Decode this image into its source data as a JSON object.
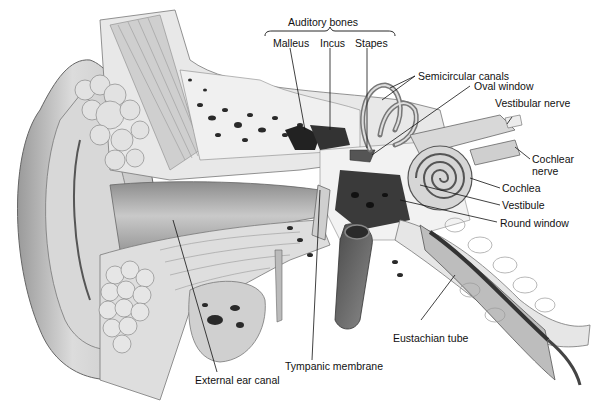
{
  "diagram": {
    "group_label": "Auditory bones",
    "labels": {
      "auditory_bones": "Auditory bones",
      "malleus": "Malleus",
      "incus": "Incus",
      "stapes": "Stapes",
      "semicircular_canals": "Semicircular canals",
      "oval_window": "Oval window",
      "vestibular_nerve": "Vestibular nerve",
      "cochlear_nerve_line1": "Cochlear",
      "cochlear_nerve_line2": "nerve",
      "cochlea": "Cochlea",
      "vestibule": "Vestibule",
      "round_window": "Round window",
      "eustachian_tube": "Eustachian tube",
      "tympanic_membrane": "Tympanic membrane",
      "external_ear_canal": "External ear canal"
    },
    "colors": {
      "background": "#ffffff",
      "tissue_light": "#e4e4e4",
      "tissue_mid": "#b8b8b8",
      "tissue_dark": "#5a5a5a",
      "bone_spots": "#2a2a2a",
      "label_text": "#111111",
      "leader_line": "#111111"
    }
  }
}
